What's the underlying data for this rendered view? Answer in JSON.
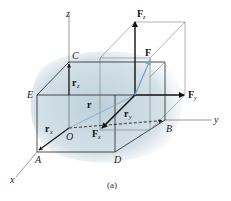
{
  "figure": {
    "caption": "(a)",
    "axes": {
      "x": "x",
      "y": "y",
      "z": "z"
    },
    "points": {
      "O": "O",
      "A": "A",
      "B": "B",
      "C": "C",
      "D": "D",
      "E": "E"
    },
    "position_vectors": {
      "r": "r",
      "r_x": {
        "base": "r",
        "sub": "x"
      },
      "r_y": {
        "base": "r",
        "sub": "y"
      },
      "r_z": {
        "base": "r",
        "sub": "z"
      }
    },
    "force_vectors": {
      "F": "F",
      "F_x": {
        "base": "F",
        "sub": "x"
      },
      "F_y": {
        "base": "F",
        "sub": "y"
      },
      "F_z": {
        "base": "F",
        "sub": "z"
      }
    },
    "colors": {
      "shading": "#b9cdd8",
      "force_F": "#7fa7c4",
      "lines": "#222222",
      "thin_lines": "#555555"
    }
  }
}
